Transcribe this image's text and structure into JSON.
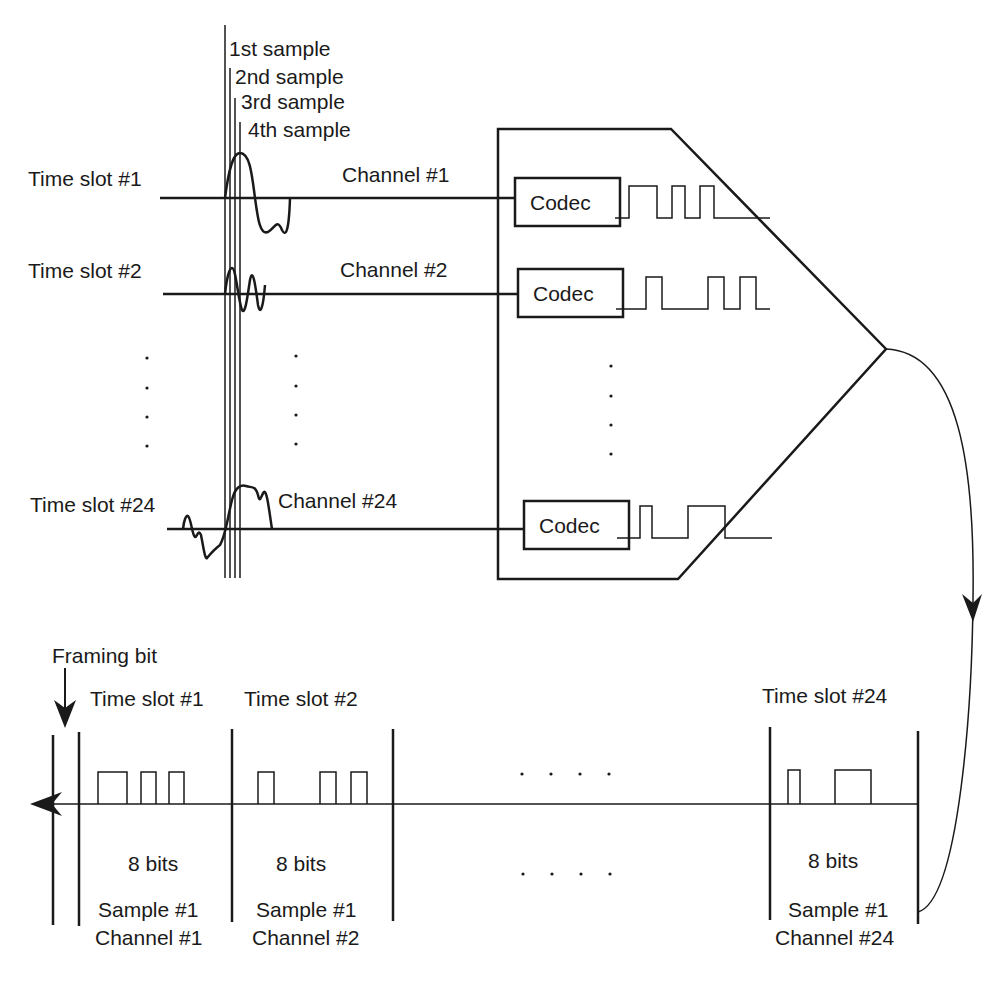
{
  "sample_labels": [
    "1st sample",
    "2nd sample",
    "3rd sample",
    "4th sample"
  ],
  "inputs": [
    {
      "time_slot": "Time slot #1",
      "channel": "Channel #1",
      "codec": "Codec"
    },
    {
      "time_slot": "Time slot #2",
      "channel": "Channel #2",
      "codec": "Codec"
    },
    {
      "time_slot": "Time slot #24",
      "channel": "Channel #24",
      "codec": "Codec"
    }
  ],
  "frame": {
    "framing_bit_label": "Framing bit",
    "slots": [
      {
        "time_slot": "Time slot #1",
        "bits": "8 bits",
        "sample": "Sample #1",
        "channel": "Channel #1"
      },
      {
        "time_slot": "Time slot #2",
        "bits": "8 bits",
        "sample": "Sample #1",
        "channel": "Channel #2"
      },
      {
        "time_slot": "Time slot #24",
        "bits": "8 bits",
        "sample": "Sample #1",
        "channel": "Channel #24"
      }
    ],
    "ellipsis": ". . . ."
  },
  "colors": {
    "ink": "#1a1a1a",
    "background": "#ffffff"
  }
}
